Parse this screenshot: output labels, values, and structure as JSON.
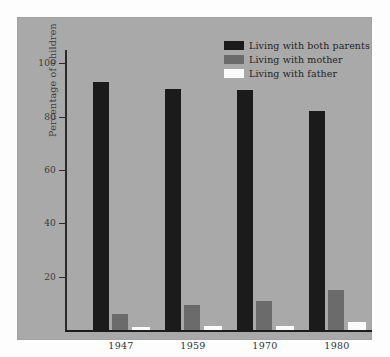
{
  "chart_data": {
    "type": "bar",
    "title": "",
    "xlabel": "",
    "ylabel": "Percentage of children",
    "categories": [
      "1947",
      "1959",
      "1970",
      "1980"
    ],
    "ylim": [
      0,
      105
    ],
    "yticks": [
      20,
      40,
      60,
      80,
      100
    ],
    "ytick_labels": [
      "20",
      "40",
      "60",
      "80",
      "100"
    ],
    "grid": false,
    "legend_position": "top-right",
    "series": [
      {
        "name": "Living with both parents",
        "color": "#1b1b1b",
        "values": [
          93,
          90.5,
          90,
          82
        ]
      },
      {
        "name": "Living with mother",
        "color": "#6b6b6b",
        "values": [
          6,
          9.5,
          11,
          15
        ]
      },
      {
        "name": "Living with father",
        "color": "#fbfbfb",
        "values": [
          1,
          1.5,
          1.5,
          3
        ]
      }
    ]
  },
  "legend": {
    "items": [
      {
        "label": "Living with both parents",
        "color": "#1b1b1b"
      },
      {
        "label": "Living with mother",
        "color": "#6b6b6b"
      },
      {
        "label": "Living with father",
        "color": "#fbfbfb"
      }
    ]
  },
  "axes": {
    "y_title": "Percentage of children",
    "y_tick_labels": [
      "100",
      "80",
      "60",
      "40",
      "20"
    ],
    "x_tick_labels": [
      "1947",
      "1959",
      "1970",
      "1980"
    ]
  },
  "colors": {
    "panel_background": "#a9a9a9",
    "page_background": "#fdfdfd",
    "axis": "#1c1c1c",
    "text": "#333333"
  }
}
